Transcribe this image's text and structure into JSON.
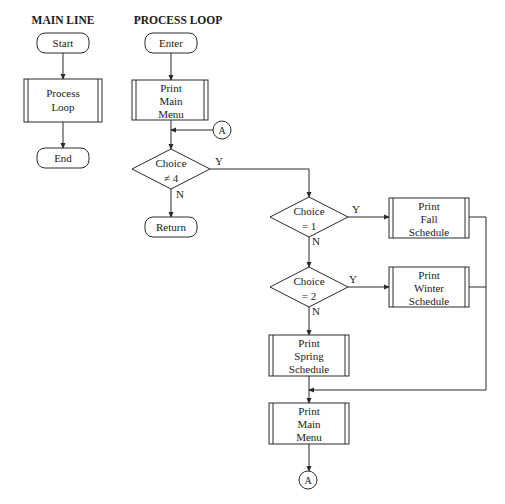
{
  "headings": {
    "main_line": "MAIN LINE",
    "process_loop": "PROCESS LOOP"
  },
  "main_line": {
    "start": "Start",
    "process": [
      "Process",
      "Loop"
    ],
    "end": "End"
  },
  "process_loop": {
    "enter": "Enter",
    "print_main_menu_1": [
      "Print",
      "Main",
      "Menu"
    ],
    "connector_in": "A",
    "decision_1": [
      "Choice",
      "≠ 4"
    ],
    "decision_1_yes": "Y",
    "decision_1_no": "N",
    "return": "Return",
    "decision_2": [
      "Choice",
      "= 1"
    ],
    "decision_2_yes": "Y",
    "decision_2_no": "N",
    "print_fall": [
      "Print",
      "Fall",
      "Schedule"
    ],
    "decision_3": [
      "Choice",
      "= 2"
    ],
    "decision_3_yes": "Y",
    "decision_3_no": "N",
    "print_winter": [
      "Print",
      "Winter",
      "Schedule"
    ],
    "print_spring": [
      "Print",
      "Spring",
      "Schedule"
    ],
    "print_main_menu_2": [
      "Print",
      "Main",
      "Menu"
    ],
    "connector_out": "A"
  }
}
